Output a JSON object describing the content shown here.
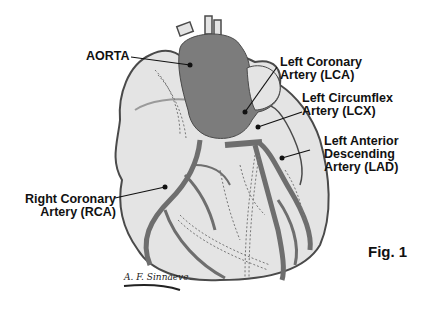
{
  "figure": {
    "caption": "Fig. 1",
    "signature": "A. F. Sinnaeve",
    "colors": {
      "heart_fill": "#e4e4e4",
      "outline": "#4a4a4a",
      "aorta": "#7c7c7c",
      "artery": "#6e6e6e",
      "label_text": "#111111"
    }
  },
  "labels": {
    "aorta": {
      "line1": "AORTA"
    },
    "lca": {
      "line1": "Left Coronary",
      "line2": "Artery (LCA)"
    },
    "lcx": {
      "line1": "Left Circumflex",
      "line2": "Artery (LCX)"
    },
    "lad": {
      "line1": "Left Anterior",
      "line2": "Descending",
      "line3": "Artery (LAD)"
    },
    "rca": {
      "line1": "Right Coronary",
      "line2": "Artery (RCA)"
    }
  }
}
